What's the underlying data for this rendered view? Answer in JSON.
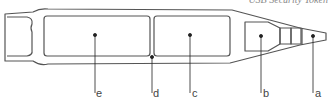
{
  "caption": "USB Security Token",
  "colors": {
    "stroke": "#555555",
    "leader": "#222222",
    "label": "#444444"
  },
  "diagram": {
    "labels": [
      {
        "id": "a",
        "text": "a",
        "x": 316,
        "dot": [
          313,
          36
        ]
      },
      {
        "id": "b",
        "text": "b",
        "x": 263,
        "dot": [
          261,
          36
        ]
      },
      {
        "id": "c",
        "text": "c",
        "x": 191,
        "dot": [
          190,
          35
        ]
      },
      {
        "id": "d",
        "text": "d",
        "x": 153,
        "dot": [
          152,
          57
        ]
      },
      {
        "id": "e",
        "text": "e",
        "x": 97,
        "dot": [
          95,
          35
        ]
      }
    ]
  }
}
